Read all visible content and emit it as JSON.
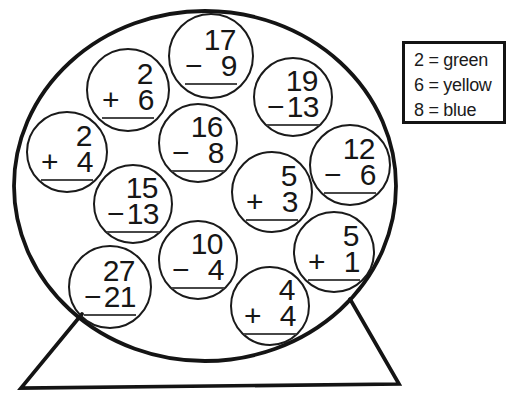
{
  "colors": {
    "ink": "#161616",
    "paper": "#ffffff"
  },
  "legend": {
    "items": [
      {
        "value": "2",
        "color": "green",
        "text": "2 = green"
      },
      {
        "value": "6",
        "color": "yellow",
        "text": "6 = yellow"
      },
      {
        "value": "8",
        "color": "blue",
        "text": "8 = blue"
      }
    ]
  },
  "problems": [
    {
      "top": "17",
      "operator": "−",
      "bottom": "9"
    },
    {
      "top": "2",
      "operator": "+",
      "bottom": "6"
    },
    {
      "top": "19",
      "operator": "−",
      "bottom": "13"
    },
    {
      "top": "2",
      "operator": "+",
      "bottom": "4"
    },
    {
      "top": "16",
      "operator": "−",
      "bottom": "8"
    },
    {
      "top": "12",
      "operator": "−",
      "bottom": "6"
    },
    {
      "top": "15",
      "operator": "−",
      "bottom": "13"
    },
    {
      "top": "5",
      "operator": "+",
      "bottom": "3"
    },
    {
      "top": "10",
      "operator": "−",
      "bottom": "4"
    },
    {
      "top": "5",
      "operator": "+",
      "bottom": "1"
    },
    {
      "top": "27",
      "operator": "−",
      "bottom": "21"
    },
    {
      "top": "4",
      "operator": "+",
      "bottom": "4"
    }
  ]
}
